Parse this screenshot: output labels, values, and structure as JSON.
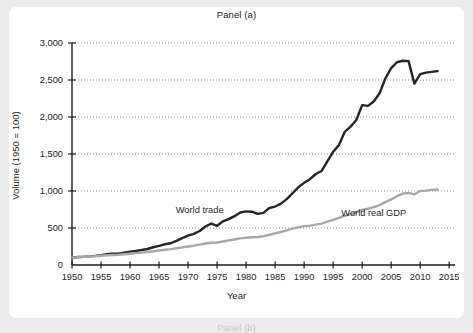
{
  "figure": {
    "background_color": "#ececec",
    "card_color": "#ffffff",
    "next_panel_label": "Panel (b)"
  },
  "chart_data": {
    "type": "line",
    "title": "Panel (a)",
    "xlabel": "Year",
    "ylabel": "Volume (1950 = 100)",
    "xlim": [
      1950,
      2016
    ],
    "ylim": [
      0,
      3000
    ],
    "xticks": [
      1950,
      1955,
      1960,
      1965,
      1970,
      1975,
      1980,
      1985,
      1990,
      1995,
      2000,
      2005,
      2010,
      2015
    ],
    "xtick_labels": [
      "1950",
      "1955",
      "1960",
      "1965",
      "1970",
      "1975",
      "1980",
      "1985",
      "1990",
      "1995",
      "2000",
      "2005",
      "2010",
      "2015"
    ],
    "yticks": [
      0,
      500,
      1000,
      1500,
      2000,
      2500,
      3000
    ],
    "ytick_labels": [
      "0",
      "500",
      "1,000",
      "1,500",
      "2,000",
      "2,500",
      "3,000"
    ],
    "grid": true,
    "grid_style": "dotted",
    "grid_color": "#8c8c8c",
    "legend_position": "inline-annotation",
    "series": [
      {
        "name": "World trade",
        "color": "#262626",
        "label_x": 1972,
        "label_y": 700,
        "x": [
          1950,
          1951,
          1952,
          1953,
          1954,
          1955,
          1956,
          1957,
          1958,
          1959,
          1960,
          1961,
          1962,
          1963,
          1964,
          1965,
          1966,
          1967,
          1968,
          1969,
          1970,
          1971,
          1972,
          1973,
          1974,
          1975,
          1976,
          1977,
          1978,
          1979,
          1980,
          1981,
          1982,
          1983,
          1984,
          1985,
          1986,
          1987,
          1988,
          1989,
          1990,
          1991,
          1992,
          1993,
          1994,
          1995,
          1996,
          1997,
          1998,
          1999,
          2000,
          2001,
          2002,
          2003,
          2004,
          2005,
          2006,
          2007,
          2008,
          2009,
          2010,
          2011,
          2012,
          2013
        ],
        "values": [
          100,
          108,
          110,
          116,
          124,
          134,
          146,
          154,
          152,
          166,
          180,
          190,
          202,
          216,
          240,
          258,
          280,
          294,
          326,
          364,
          396,
          420,
          460,
          520,
          560,
          530,
          590,
          620,
          660,
          710,
          725,
          720,
          690,
          705,
          770,
          790,
          830,
          890,
          970,
          1050,
          1110,
          1160,
          1230,
          1270,
          1400,
          1530,
          1620,
          1800,
          1870,
          1960,
          2160,
          2150,
          2210,
          2320,
          2520,
          2660,
          2740,
          2760,
          2755,
          2450,
          2580,
          2600,
          2610,
          2620
        ]
      },
      {
        "name": "World real GDP",
        "color": "#a8a8a8",
        "label_x": 2002,
        "label_y": 660,
        "x": [
          1950,
          1951,
          1952,
          1953,
          1954,
          1955,
          1956,
          1957,
          1958,
          1959,
          1960,
          1961,
          1962,
          1963,
          1964,
          1965,
          1966,
          1967,
          1968,
          1969,
          1970,
          1971,
          1972,
          1973,
          1974,
          1975,
          1976,
          1977,
          1978,
          1979,
          1980,
          1981,
          1982,
          1983,
          1984,
          1985,
          1986,
          1987,
          1988,
          1989,
          1990,
          1991,
          1992,
          1993,
          1994,
          1995,
          1996,
          1997,
          1998,
          1999,
          2000,
          2001,
          2002,
          2003,
          2004,
          2005,
          2006,
          2007,
          2008,
          2009,
          2010,
          2011,
          2012,
          2013
        ],
        "values": [
          100,
          105,
          110,
          115,
          119,
          126,
          131,
          136,
          139,
          146,
          153,
          160,
          168,
          176,
          186,
          196,
          206,
          214,
          226,
          239,
          250,
          261,
          275,
          291,
          300,
          304,
          318,
          332,
          345,
          359,
          368,
          375,
          378,
          389,
          409,
          427,
          446,
          467,
          491,
          510,
          525,
          532,
          545,
          560,
          585,
          610,
          636,
          665,
          686,
          710,
          745,
          760,
          782,
          810,
          850,
          886,
          930,
          965,
          975,
          955,
          1000,
          1005,
          1015,
          1020
        ]
      }
    ]
  }
}
